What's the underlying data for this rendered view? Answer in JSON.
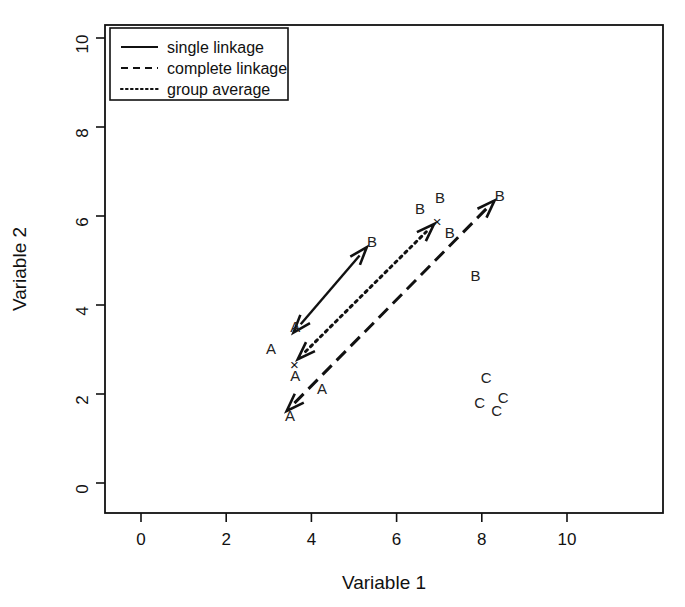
{
  "chart_data": {
    "type": "scatter",
    "title": "",
    "xlabel": "Variable 1",
    "ylabel": "Variable 2",
    "xlim": [
      -1.3,
      11.3
    ],
    "ylim": [
      -0.7,
      10.3
    ],
    "xticks": [
      "0",
      "2",
      "4",
      "6",
      "8",
      "10"
    ],
    "xtick_values": [
      0,
      2,
      4,
      6,
      8,
      10
    ],
    "yticks": [
      "0",
      "2",
      "4",
      "6",
      "8",
      "10"
    ],
    "ytick_values": [
      0,
      2,
      4,
      6,
      8,
      10
    ],
    "grid": false,
    "frame": true,
    "legend_position": "top-left",
    "legend": [
      {
        "label": "single linkage",
        "style": "solid"
      },
      {
        "label": "complete linkage",
        "style": "dashed"
      },
      {
        "label": "group average",
        "style": "dotted"
      }
    ],
    "series": [
      {
        "name": "Cluster A",
        "marker": "A",
        "points": [
          {
            "x": 3.5,
            "y": 1.52,
            "label": "A"
          },
          {
            "x": 4.25,
            "y": 2.12,
            "label": "A"
          },
          {
            "x": 3.05,
            "y": 3.02,
            "label": "A"
          },
          {
            "x": 3.62,
            "y": 2.42,
            "label": "A"
          },
          {
            "x": 3.62,
            "y": 3.52,
            "label": "A"
          }
        ]
      },
      {
        "name": "Cluster B",
        "marker": "B",
        "points": [
          {
            "x": 5.42,
            "y": 5.42,
            "label": "B"
          },
          {
            "x": 6.55,
            "y": 6.17,
            "label": "B"
          },
          {
            "x": 7.02,
            "y": 6.42,
            "label": "B"
          },
          {
            "x": 8.42,
            "y": 6.47,
            "label": "B"
          },
          {
            "x": 7.25,
            "y": 5.62,
            "label": "B"
          },
          {
            "x": 7.85,
            "y": 4.67,
            "label": "B"
          }
        ]
      },
      {
        "name": "Cluster C",
        "marker": "C",
        "points": [
          {
            "x": 8.1,
            "y": 2.37,
            "label": "C"
          },
          {
            "x": 7.95,
            "y": 1.82,
            "label": "C"
          },
          {
            "x": 8.5,
            "y": 1.92,
            "label": "C"
          },
          {
            "x": 8.35,
            "y": 1.62,
            "label": "C"
          }
        ]
      },
      {
        "name": "Centroids",
        "marker": "x",
        "points": [
          {
            "x": 3.6,
            "y": 2.65,
            "label": "×"
          },
          {
            "x": 6.95,
            "y": 5.87,
            "label": "×"
          }
        ]
      }
    ],
    "annotations": [
      {
        "name": "single-linkage-arrow",
        "style": "solid",
        "from": {
          "x": 3.58,
          "y": 3.38
        },
        "to": {
          "x": 5.3,
          "y": 5.3
        },
        "arrowheads": "both"
      },
      {
        "name": "complete-linkage-arrow",
        "style": "dashed",
        "from": {
          "x": 3.42,
          "y": 1.62
        },
        "to": {
          "x": 8.3,
          "y": 6.35
        },
        "arrowheads": "both"
      },
      {
        "name": "group-average-arrow",
        "style": "dotted",
        "from": {
          "x": 3.68,
          "y": 2.78
        },
        "to": {
          "x": 6.88,
          "y": 5.82
        },
        "arrowheads": "both"
      }
    ]
  },
  "axes": {
    "x_title": "Variable 1",
    "y_title": "Variable 2"
  }
}
